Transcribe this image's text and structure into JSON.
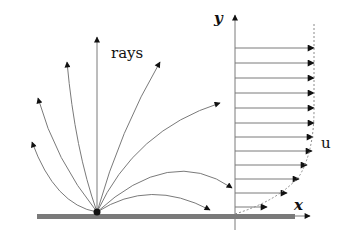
{
  "figure": {
    "labels": {
      "rays": "rays",
      "y_axis": "y",
      "x_axis": "x",
      "velocity_profile": "u"
    },
    "colors": {
      "wall": "#7a7a7a",
      "lines": "#7a7a7a",
      "arrowheads": "#111111",
      "source_point": "#111111",
      "profile_dashed": "#8a8a8a"
    },
    "source_point": {
      "x": 97,
      "y": 212
    },
    "wall": {
      "x1": 37,
      "x2": 295,
      "y": 214,
      "thickness": 5
    },
    "y_axis": {
      "x": 235,
      "y_top": 15,
      "y_bottom": 230
    },
    "x_axis": {
      "x_end": 310,
      "y": 216
    },
    "rays": [
      {
        "name": "ray-1",
        "path": "M97,212 Q55,205 32,142"
      },
      {
        "name": "ray-2",
        "path": "M97,212 Q55,160 38,98"
      },
      {
        "name": "ray-3",
        "path": "M97,212 Q75,150 67,62"
      },
      {
        "name": "ray-4",
        "path": "M97,212 L97,37"
      },
      {
        "name": "ray-5",
        "path": "M97,212 Q120,130 160,62"
      },
      {
        "name": "ray-6",
        "path": "M97,212 Q135,130 220,103"
      },
      {
        "name": "ray-7",
        "path": "M97,212 Q170,145 232,188"
      },
      {
        "name": "ray-8",
        "path": "M97,212 Q150,178 210,210"
      }
    ],
    "velocity_arrows": [
      {
        "y": 48,
        "length": 79
      },
      {
        "y": 63,
        "length": 79
      },
      {
        "y": 78,
        "length": 79
      },
      {
        "y": 93,
        "length": 79
      },
      {
        "y": 108,
        "length": 79
      },
      {
        "y": 123,
        "length": 79
      },
      {
        "y": 137,
        "length": 78
      },
      {
        "y": 151,
        "length": 77
      },
      {
        "y": 165,
        "length": 72
      },
      {
        "y": 179,
        "length": 64
      },
      {
        "y": 193,
        "length": 52
      },
      {
        "y": 207,
        "length": 32
      }
    ],
    "profile_path": "M314,24 L314,110 Q314,150 300,175 Q280,200 235,214"
  }
}
